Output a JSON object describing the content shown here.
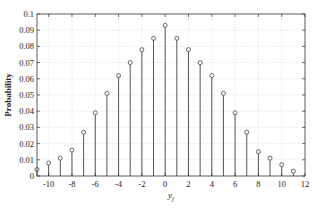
{
  "chart_data": {
    "type": "stem",
    "title": "",
    "xlabel": "y",
    "xlabel_subscript": "j",
    "ylabel": "Probability",
    "xlim": [
      -11,
      12
    ],
    "ylim": [
      0,
      0.1
    ],
    "grid": true,
    "legend": null,
    "xticks": [
      -10,
      -8,
      -6,
      -4,
      -2,
      0,
      2,
      4,
      6,
      8,
      10,
      12
    ],
    "yticks": [
      0,
      0.01,
      0.02,
      0.03,
      0.04,
      0.05,
      0.06,
      0.07,
      0.08,
      0.09,
      0.1
    ],
    "ytick_labels": [
      "0",
      "0.01",
      "0.02",
      "0.03",
      "0.04",
      "0.05",
      "0.06",
      "0.07",
      "0.08",
      "0.09",
      "0.1"
    ],
    "x": [
      -11,
      -10,
      -9,
      -8,
      -7,
      -6,
      -5,
      -4,
      -3,
      -2,
      -1,
      0,
      1,
      2,
      3,
      4,
      5,
      6,
      7,
      8,
      9,
      10,
      11
    ],
    "values": [
      0.004,
      0.008,
      0.011,
      0.016,
      0.027,
      0.039,
      0.051,
      0.062,
      0.07,
      0.078,
      0.085,
      0.093,
      0.085,
      0.078,
      0.07,
      0.062,
      0.051,
      0.039,
      0.027,
      0.015,
      0.011,
      0.007,
      0.003
    ],
    "colors": {
      "stem": "#555555",
      "marker_edge": "#444444",
      "axis": "#333333",
      "grid": "#cfcfcf"
    }
  }
}
